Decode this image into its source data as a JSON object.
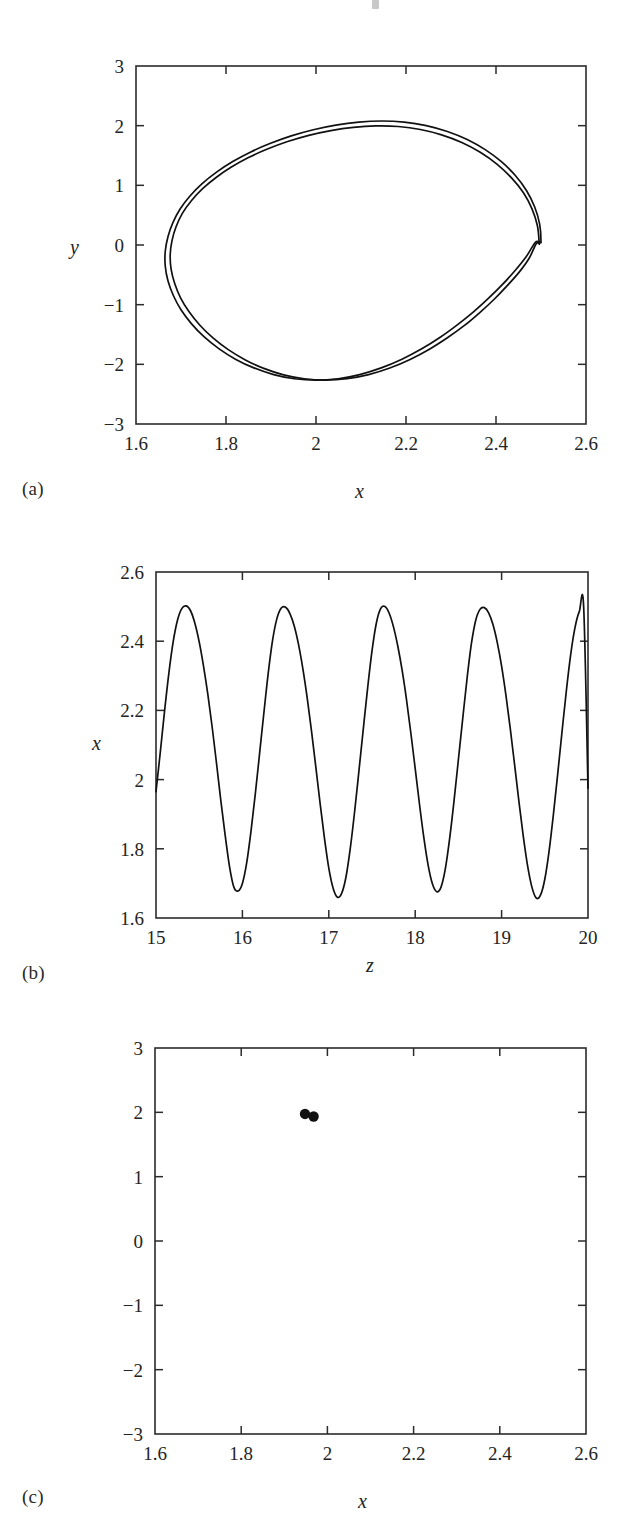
{
  "figure": {
    "background_color": "#ffffff",
    "ink_color": "#111111",
    "panel_labels": {
      "a": "(a)",
      "b": "(b)",
      "c": "(c)"
    }
  },
  "chart_data": [
    {
      "panel": "(a)",
      "type": "line",
      "title": "",
      "xlabel": "x",
      "ylabel": "y",
      "xlim": [
        1.6,
        2.6
      ],
      "ylim": [
        -3,
        3
      ],
      "xticks": [
        1.6,
        1.8,
        2,
        2.2,
        2.4,
        2.6
      ],
      "xticklabels": [
        "1.6",
        "1.8",
        "2",
        "2.2",
        "2.4",
        "2.6"
      ],
      "yticks": [
        -3,
        -2,
        -1,
        0,
        1,
        2,
        3
      ],
      "yticklabels": [
        "-3",
        "-2",
        "-1",
        "0",
        "1",
        "2",
        "3"
      ],
      "grid": false,
      "legend": "none",
      "description": "Phase-plane trajectory: closed period-2 limit cycle made of two nearly coincident loops",
      "series": [
        {
          "name": "outer-loop",
          "x": [
            2.5,
            2.497,
            2.486,
            2.468,
            2.443,
            2.412,
            2.376,
            2.336,
            2.292,
            2.245,
            2.196,
            2.146,
            2.095,
            2.044,
            1.994,
            1.945,
            1.899,
            1.855,
            1.815,
            1.779,
            1.747,
            1.72,
            1.698,
            1.682,
            1.671,
            1.665,
            1.665,
            1.671,
            1.683,
            1.7,
            1.723,
            1.751,
            1.784,
            1.821,
            1.862,
            1.906,
            1.952,
            2.0,
            2.049,
            2.097,
            2.145,
            2.191,
            2.235,
            2.276,
            2.314,
            2.35,
            2.383,
            2.414,
            2.442,
            2.467,
            2.487,
            2.497,
            2.5
          ],
          "y": [
            0.06,
            0.35,
            0.636,
            0.91,
            1.165,
            1.396,
            1.598,
            1.768,
            1.903,
            2.002,
            2.06,
            2.078,
            2.06,
            2.01,
            1.932,
            1.829,
            1.704,
            1.56,
            1.398,
            1.221,
            1.028,
            0.822,
            0.604,
            0.375,
            0.138,
            -0.105,
            -0.352,
            -0.6,
            -0.846,
            -1.086,
            -1.317,
            -1.536,
            -1.736,
            -1.913,
            -2.06,
            -2.172,
            -2.242,
            -2.266,
            -2.242,
            -2.172,
            -2.06,
            -1.914,
            -1.74,
            -1.546,
            -1.338,
            -1.12,
            -0.895,
            -0.665,
            -0.432,
            -0.197,
            0.04,
            0.05,
            0.06
          ]
        },
        {
          "name": "inner-loop",
          "x": [
            2.496,
            2.492,
            2.48,
            2.461,
            2.434,
            2.402,
            2.365,
            2.324,
            2.279,
            2.232,
            2.183,
            2.133,
            2.083,
            2.033,
            1.984,
            1.937,
            1.892,
            1.85,
            1.812,
            1.778,
            1.748,
            1.723,
            1.703,
            1.689,
            1.68,
            1.676,
            1.678,
            1.686,
            1.699,
            1.718,
            1.742,
            1.771,
            1.805,
            1.843,
            1.884,
            1.928,
            1.974,
            2.021,
            2.069,
            2.117,
            2.164,
            2.209,
            2.252,
            2.292,
            2.33,
            2.364,
            2.396,
            2.425,
            2.452,
            2.474,
            2.489,
            2.495,
            2.496
          ],
          "y": [
            0.035,
            0.322,
            0.606,
            0.876,
            1.128,
            1.356,
            1.554,
            1.718,
            1.846,
            1.936,
            1.986,
            1.996,
            1.972,
            1.918,
            1.838,
            1.734,
            1.608,
            1.466,
            1.306,
            1.132,
            0.944,
            0.742,
            0.529,
            0.306,
            0.074,
            -0.163,
            -0.404,
            -0.646,
            -0.886,
            -1.12,
            -1.345,
            -1.558,
            -1.754,
            -1.926,
            -2.068,
            -2.176,
            -2.242,
            -2.264,
            -2.24,
            -2.172,
            -2.062,
            -1.918,
            -1.746,
            -1.554,
            -1.348,
            -1.132,
            -0.909,
            -0.681,
            -0.45,
            -0.217,
            0.018,
            0.028,
            0.035
          ]
        }
      ]
    },
    {
      "panel": "(b)",
      "type": "line",
      "title": "",
      "xlabel": "z",
      "ylabel": "x",
      "xlim": [
        15,
        20
      ],
      "ylim": [
        1.6,
        2.6
      ],
      "xticks": [
        15,
        16,
        17,
        18,
        19,
        20
      ],
      "xticklabels": [
        "15",
        "16",
        "17",
        "18",
        "19",
        "20"
      ],
      "yticks": [
        1.6,
        1.8,
        2,
        2.2,
        2.4,
        2.6
      ],
      "yticklabels": [
        "1.6",
        "1.8",
        "2",
        "2.2",
        "2.4",
        "2.6"
      ],
      "grid": false,
      "legend": "none",
      "description": "Time series of x versus z showing five oscillations of period approximately 1.0 with slightly alternating minima (period-2 signature)",
      "n_peaks": 5,
      "peak_positions": [
        15.35,
        16.32,
        17.32,
        18.33,
        19.32
      ],
      "peak_values": [
        2.502,
        2.498,
        2.5,
        2.497,
        2.499
      ],
      "trough_positions": [
        15.82,
        16.81,
        17.82,
        18.81,
        19.81
      ],
      "trough_values": [
        1.678,
        1.658,
        1.676,
        1.649,
        1.672
      ],
      "start_value": 1.965,
      "end_value": 1.975,
      "series": [
        {
          "name": "x(z)",
          "x": [
            15.0,
            15.05,
            15.1,
            15.15,
            15.2,
            15.25,
            15.3,
            15.35,
            15.4,
            15.45,
            15.5,
            15.55,
            15.6,
            15.65,
            15.7,
            15.75,
            15.8,
            15.85,
            15.9,
            15.95,
            16.0,
            16.05,
            16.1,
            16.15,
            16.2,
            16.25,
            16.3,
            16.35,
            16.4,
            16.45,
            16.5,
            16.55,
            16.6,
            16.65,
            16.7,
            16.75,
            16.8,
            16.85,
            16.9,
            16.95,
            17.0,
            17.05,
            17.1,
            17.15,
            17.2,
            17.25,
            17.3,
            17.35,
            17.4,
            17.45,
            17.5,
            17.55,
            17.6,
            17.65,
            17.7,
            17.75,
            17.8,
            17.85,
            17.9,
            17.95,
            18.0,
            18.05,
            18.1,
            18.15,
            18.2,
            18.25,
            18.3,
            18.35,
            18.4,
            18.45,
            18.5,
            18.55,
            18.6,
            18.65,
            18.7,
            18.75,
            18.8,
            18.85,
            18.9,
            18.95,
            19.0,
            19.05,
            19.1,
            19.15,
            19.2,
            19.25,
            19.3,
            19.35,
            19.4,
            19.45,
            19.5,
            19.55,
            19.6,
            19.65,
            19.7,
            19.75,
            19.8,
            19.85,
            19.9,
            19.95,
            20.0
          ],
          "y": [
            1.965,
            2.08,
            2.2,
            2.31,
            2.4,
            2.462,
            2.495,
            2.502,
            2.488,
            2.452,
            2.398,
            2.328,
            2.246,
            2.152,
            2.048,
            1.94,
            1.84,
            1.75,
            1.69,
            1.678,
            1.7,
            1.76,
            1.852,
            1.96,
            2.078,
            2.196,
            2.31,
            2.404,
            2.466,
            2.496,
            2.498,
            2.48,
            2.444,
            2.39,
            2.32,
            2.236,
            2.14,
            2.036,
            1.93,
            1.83,
            1.744,
            1.686,
            1.66,
            1.672,
            1.72,
            1.804,
            1.91,
            2.028,
            2.148,
            2.266,
            2.372,
            2.452,
            2.494,
            2.5,
            2.48,
            2.44,
            2.384,
            2.314,
            2.23,
            2.134,
            2.032,
            1.928,
            1.832,
            1.752,
            1.698,
            1.676,
            1.69,
            1.744,
            1.832,
            1.94,
            2.058,
            2.176,
            2.292,
            2.392,
            2.46,
            2.492,
            2.497,
            2.482,
            2.448,
            2.396,
            2.328,
            2.244,
            2.148,
            2.044,
            1.938,
            1.838,
            1.752,
            1.69,
            1.658,
            1.666,
            1.712,
            1.794,
            1.9,
            2.018,
            2.14,
            2.258,
            2.362,
            2.44,
            2.486,
            2.498,
            1.975
          ]
        }
      ]
    },
    {
      "panel": "(c)",
      "type": "scatter",
      "title": "",
      "xlabel": "x",
      "ylabel": "y",
      "xlim": [
        1.6,
        2.6
      ],
      "ylim": [
        -3,
        3
      ],
      "xticks": [
        1.6,
        1.8,
        2,
        2.2,
        2.4,
        2.6
      ],
      "xticklabels": [
        "1.6",
        "1.8",
        "2",
        "2.2",
        "2.4",
        "2.6"
      ],
      "yticks": [
        -3,
        -2,
        -1,
        0,
        1,
        2,
        3
      ],
      "yticklabels": [
        "-3",
        "-2",
        "-1",
        "0",
        "1",
        "2",
        "3"
      ],
      "grid": false,
      "legend": "none",
      "description": "Poincare section showing two isolated points, confirming a period-2 orbit",
      "n_points": 2,
      "points": [
        {
          "x": 1.948,
          "y": 1.975
        },
        {
          "x": 1.968,
          "y": 1.935
        }
      ]
    }
  ]
}
